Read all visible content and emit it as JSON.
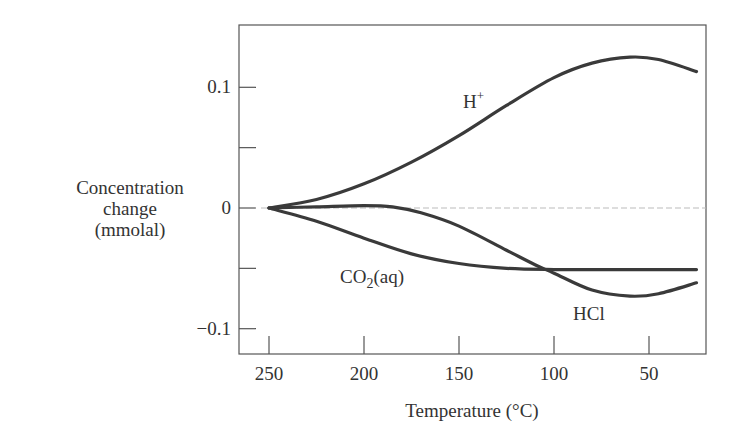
{
  "chart_data": {
    "type": "line",
    "title": "",
    "xlabel": "Temperature (°C)",
    "ylabel": [
      "Concentration",
      "change",
      "(mmolal)"
    ],
    "xlim": [
      265,
      20
    ],
    "ylim": [
      -0.12,
      0.15
    ],
    "x_reversed": true,
    "x_ticks": [
      250,
      200,
      150,
      100,
      50
    ],
    "x_tick_labels": [
      "250",
      "200",
      "150",
      "100",
      "50"
    ],
    "y_ticks": [
      0.1,
      0.05,
      0,
      -0.05,
      -0.1
    ],
    "y_tick_labels": [
      "0.1",
      "",
      "0",
      "",
      "−0.1"
    ],
    "grid": false,
    "zero_reference_line": true,
    "series": [
      {
        "name": "H+",
        "label": "H",
        "label_sup": "+",
        "x": [
          250,
          225,
          200,
          175,
          150,
          125,
          100,
          80,
          60,
          45,
          25
        ],
        "values": [
          0,
          0.007,
          0.02,
          0.038,
          0.06,
          0.085,
          0.108,
          0.12,
          0.125,
          0.123,
          0.113
        ]
      },
      {
        "name": "HCl",
        "label": "HCl",
        "label_sup": "",
        "x": [
          250,
          225,
          200,
          185,
          170,
          150,
          125,
          110,
          100,
          80,
          60,
          45,
          25
        ],
        "values": [
          0,
          0.001,
          0.002,
          0.001,
          -0.004,
          -0.015,
          -0.035,
          -0.047,
          -0.054,
          -0.068,
          -0.073,
          -0.071,
          -0.062
        ]
      },
      {
        "name": "CO2(aq)",
        "label": "CO",
        "label_sub": "2",
        "label_suffix": "(aq)",
        "x": [
          250,
          225,
          200,
          175,
          150,
          125,
          100,
          75,
          50,
          25
        ],
        "values": [
          0,
          -0.011,
          -0.025,
          -0.038,
          -0.046,
          -0.05,
          -0.051,
          -0.051,
          -0.051,
          -0.051
        ]
      }
    ],
    "annotations": [
      {
        "text": "H+",
        "x": 150,
        "y": 0.062
      },
      {
        "text": "CO2(aq)",
        "x": 185,
        "y": -0.058
      },
      {
        "text": "HCl",
        "x": 75,
        "y": -0.09
      }
    ]
  }
}
